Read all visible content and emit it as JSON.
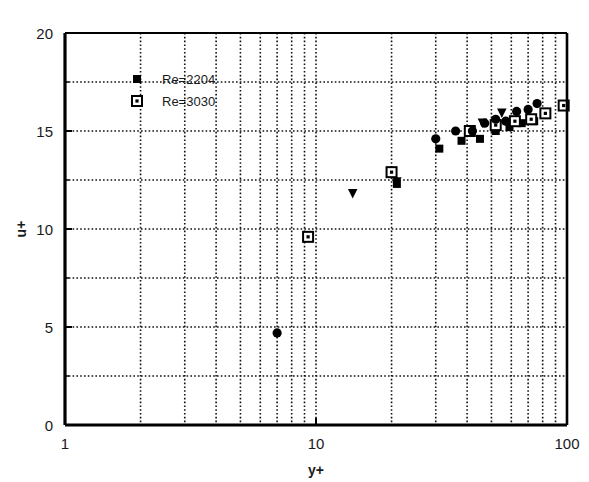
{
  "chart_data": {
    "type": "scatter",
    "title": "",
    "xlabel": "y+",
    "ylabel": "u+",
    "xscale": "log",
    "yscale": "linear",
    "xlim": [
      1,
      100
    ],
    "ylim": [
      0,
      20
    ],
    "xticks": [
      "1",
      "10",
      "100"
    ],
    "xtick_values": [
      1,
      10,
      100
    ],
    "yticks": [
      "0",
      "5",
      "10",
      "15",
      "20"
    ],
    "ytick_values": [
      0,
      5,
      10,
      15,
      20
    ],
    "grid": true,
    "grid_style": "dotted",
    "legend_position": "upper-left-inside",
    "series": [
      {
        "name": "Re=2204",
        "marker": "filled-square",
        "color": "#000000",
        "points": [
          {
            "x": 21.0,
            "y": 12.3
          },
          {
            "x": 31.0,
            "y": 14.1
          },
          {
            "x": 38.0,
            "y": 14.5
          },
          {
            "x": 45.0,
            "y": 14.6
          },
          {
            "x": 52.0,
            "y": 15.0
          },
          {
            "x": 59.0,
            "y": 15.2
          },
          {
            "x": 66.0,
            "y": 15.4
          },
          {
            "x": 74.0,
            "y": 15.5
          }
        ]
      },
      {
        "name": "Re=3030",
        "marker": "open-square-dot",
        "color": "#000000",
        "points": [
          {
            "x": 9.3,
            "y": 9.6
          },
          {
            "x": 20.0,
            "y": 12.9
          },
          {
            "x": 41.0,
            "y": 15.0
          },
          {
            "x": 52.0,
            "y": 15.3
          },
          {
            "x": 62.0,
            "y": 15.5
          },
          {
            "x": 72.0,
            "y": 15.6
          },
          {
            "x": 82.0,
            "y": 15.9
          },
          {
            "x": 97.0,
            "y": 16.3
          }
        ]
      },
      {
        "name": "circles",
        "marker": "filled-circle",
        "color": "#000000",
        "points": [
          {
            "x": 7.0,
            "y": 4.7
          },
          {
            "x": 30.0,
            "y": 14.6
          },
          {
            "x": 36.0,
            "y": 15.0
          },
          {
            "x": 42.0,
            "y": 15.0
          },
          {
            "x": 47.0,
            "y": 15.4
          },
          {
            "x": 52.0,
            "y": 15.6
          },
          {
            "x": 57.0,
            "y": 15.5
          },
          {
            "x": 63.0,
            "y": 16.0
          },
          {
            "x": 70.0,
            "y": 16.1
          },
          {
            "x": 76.0,
            "y": 16.4
          }
        ]
      },
      {
        "name": "triangles",
        "marker": "filled-triangle-down",
        "color": "#000000",
        "points": [
          {
            "x": 14.0,
            "y": 11.8
          },
          {
            "x": 21.0,
            "y": 12.4
          },
          {
            "x": 46.0,
            "y": 15.4
          },
          {
            "x": 55.0,
            "y": 15.9
          }
        ]
      }
    ],
    "legend_entries": [
      {
        "label": "Re=2204",
        "marker": "filled-square"
      },
      {
        "label": "Re=3030",
        "marker": "open-square-dot"
      }
    ]
  }
}
